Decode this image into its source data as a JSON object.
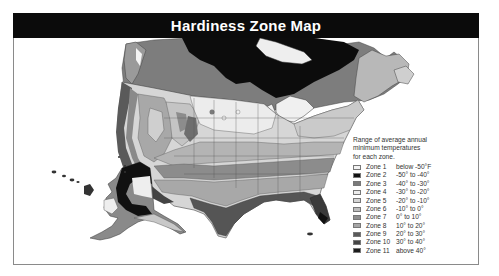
{
  "title": "Hardiness Zone Map",
  "legend": {
    "caption_lines": [
      "Range of average annual",
      "minimum temperatures",
      "for each zone."
    ],
    "zones": [
      {
        "label": "Zone 1",
        "range": "below  -50°F",
        "color": "#f2f2f2"
      },
      {
        "label": "Zone 2",
        "range": "-50°  to  -40°",
        "color": "#111111"
      },
      {
        "label": "Zone 3",
        "range": "-40°  to  -30°",
        "color": "#7a7a7a"
      },
      {
        "label": "Zone 4",
        "range": "-30°  to  -20°",
        "color": "#ececec"
      },
      {
        "label": "Zone 5",
        "range": "-20°  to  -10°",
        "color": "#d4d4d4"
      },
      {
        "label": "Zone 6",
        "range": "-10°  to     0°",
        "color": "#bdbdbd"
      },
      {
        "label": "Zone 7",
        "range": "   0°  to   10°",
        "color": "#8e8e8e"
      },
      {
        "label": "Zone 8",
        "range": "  10°  to   20°",
        "color": "#a6a6a6"
      },
      {
        "label": "Zone 9",
        "range": "  20°  to   30°",
        "color": "#5a5a5a"
      },
      {
        "label": "Zone 10",
        "range": "30°  to   40°",
        "color": "#454545"
      },
      {
        "label": "Zone 11",
        "range": "above   40°",
        "color": "#1c1c1c"
      }
    ]
  },
  "map": {
    "regions": [
      "Canada",
      "Contiguous United States",
      "Alaska",
      "Hawaii"
    ]
  }
}
